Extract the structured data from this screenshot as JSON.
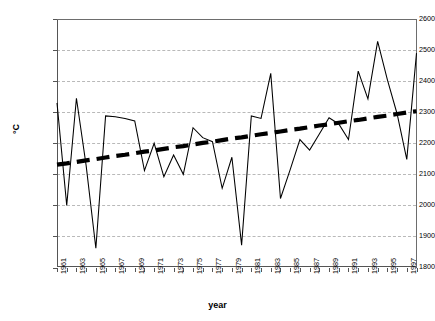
{
  "chart": {
    "type": "line",
    "title": "",
    "xlabel": "year",
    "ylabel": "°C",
    "grid": true,
    "legend": "none",
    "background": "#ffffff",
    "series_color": "#000000",
    "trend_color": "#000000",
    "gridline_color": "#b9b9b9",
    "axis_color": "#555555"
  },
  "yaxis": {
    "min": 1800,
    "max": 2600,
    "step": 100,
    "ticks": [
      1800,
      1900,
      2000,
      2100,
      2200,
      2300,
      2400,
      2500,
      2600
    ],
    "tick_labels": [
      "1800",
      "1900",
      "2000",
      "2100",
      "2200",
      "2300",
      "2400",
      "2500",
      "2600"
    ]
  },
  "xaxis": {
    "min": 1961,
    "max": 1998,
    "label_step": 2,
    "tick_labels": [
      "1961",
      "1963",
      "1965",
      "1967",
      "1969",
      "1971",
      "1973",
      "1975",
      "1977",
      "1979",
      "1981",
      "1983",
      "1985",
      "1987",
      "1989",
      "1991",
      "1993",
      "1995",
      "1997"
    ],
    "all_years": [
      1961,
      1962,
      1963,
      1964,
      1965,
      1966,
      1967,
      1968,
      1969,
      1970,
      1971,
      1972,
      1973,
      1974,
      1975,
      1976,
      1977,
      1978,
      1979,
      1980,
      1981,
      1982,
      1983,
      1984,
      1985,
      1986,
      1987,
      1988,
      1989,
      1990,
      1991,
      1992,
      1993,
      1994,
      1995,
      1996,
      1997,
      1998
    ]
  },
  "chart_data": {
    "type": "line",
    "title": "",
    "xlabel": "year",
    "ylabel": "°C",
    "xlim": [
      1961,
      1998
    ],
    "ylim": [
      1800,
      2600
    ],
    "grid": true,
    "legend": "none",
    "x": [
      1961,
      1962,
      1963,
      1964,
      1965,
      1966,
      1967,
      1968,
      1969,
      1970,
      1971,
      1972,
      1973,
      1974,
      1975,
      1976,
      1977,
      1978,
      1979,
      1980,
      1981,
      1982,
      1983,
      1984,
      1985,
      1986,
      1987,
      1988,
      1989,
      1990,
      1991,
      1992,
      1993,
      1994,
      1995,
      1996,
      1997,
      1998
    ],
    "series": [
      {
        "name": "annual value",
        "style": "thin-solid-line",
        "values": [
          2330,
          2000,
          2345,
          2128,
          1862,
          2288,
          2285,
          2280,
          2272,
          2112,
          2200,
          2092,
          2162,
          2100,
          2250,
          2218,
          2205,
          2055,
          2155,
          1872,
          2288,
          2280,
          2425,
          2022,
          2115,
          2212,
          2178,
          2230,
          2282,
          2262,
          2212,
          2432,
          2343,
          2528,
          2405,
          2295,
          2148,
          2490
        ]
      },
      {
        "name": "linear trend",
        "style": "thick-dashed-line",
        "values": [
          2131,
          2135,
          2140,
          2145,
          2149,
          2154,
          2159,
          2163,
          2168,
          2173,
          2177,
          2182,
          2187,
          2191,
          2196,
          2201,
          2205,
          2210,
          2215,
          2219,
          2224,
          2229,
          2233,
          2238,
          2243,
          2247,
          2252,
          2257,
          2261,
          2266,
          2271,
          2275,
          2280,
          2285,
          2289,
          2294,
          2299,
          2303
        ]
      }
    ]
  }
}
